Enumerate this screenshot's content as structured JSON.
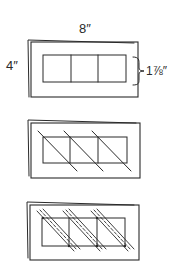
{
  "diagram": {
    "step1": {
      "width_label": "8″",
      "height_label": "4″",
      "window_height_label": "1⅞″",
      "windows": 3
    },
    "step2": {
      "windows": 3,
      "diagonals": "single"
    },
    "step3": {
      "windows": 3,
      "diagonals": "double-dashed"
    },
    "colors": {
      "line": "#2a2a2a",
      "background": "#ffffff"
    }
  }
}
